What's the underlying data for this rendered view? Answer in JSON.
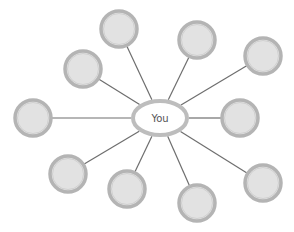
{
  "diagram": {
    "type": "hub-and-spoke",
    "hub": {
      "label": "You",
      "cx": 160,
      "cy": 118,
      "rx": 27,
      "ry": 17
    },
    "nodes": [
      {
        "id": "node-top-center",
        "cx": 119,
        "cy": 29,
        "r": 18,
        "label": ""
      },
      {
        "id": "node-top-right",
        "cx": 197,
        "cy": 40,
        "r": 18,
        "label": ""
      },
      {
        "id": "node-upper-left",
        "cx": 83,
        "cy": 69,
        "r": 18,
        "label": ""
      },
      {
        "id": "node-far-upper-right",
        "cx": 263,
        "cy": 56,
        "r": 18,
        "label": ""
      },
      {
        "id": "node-left",
        "cx": 33,
        "cy": 118,
        "r": 18,
        "label": ""
      },
      {
        "id": "node-right",
        "cx": 240,
        "cy": 118,
        "r": 18,
        "label": ""
      },
      {
        "id": "node-lower-left",
        "cx": 68,
        "cy": 174,
        "r": 18,
        "label": ""
      },
      {
        "id": "node-bottom-center-left",
        "cx": 127,
        "cy": 189,
        "r": 18,
        "label": ""
      },
      {
        "id": "node-bottom-center-right",
        "cx": 197,
        "cy": 203,
        "r": 18,
        "label": ""
      },
      {
        "id": "node-lower-right",
        "cx": 263,
        "cy": 183,
        "r": 18,
        "label": ""
      }
    ],
    "colors": {
      "node_fill": "#e2e2e2",
      "node_ring": "#b4b4b4",
      "node_inner_ring": "#d0d0d0",
      "hub_fill": "#ffffff",
      "hub_ring": "#bdbdbd",
      "connector": "#6e6e6e",
      "background": "#ffffff"
    }
  }
}
